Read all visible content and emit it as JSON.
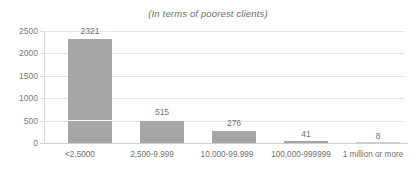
{
  "chart_data": {
    "type": "bar",
    "title": "(In terms of poorest clients)",
    "xlabel": "",
    "ylabel": "",
    "categories": [
      "<2,5000",
      "2,500-9.999",
      "10.000-99.999",
      "100,000-999999",
      "1 million or more"
    ],
    "values": [
      2321,
      515,
      276,
      41,
      8
    ],
    "datalabels": [
      "2321",
      "515",
      "276",
      "41",
      "8"
    ],
    "ylim": [
      0,
      2500
    ],
    "yticks": [
      0,
      500,
      1000,
      1500,
      2000,
      2500
    ],
    "ytick_labels": [
      "0",
      "500",
      "1000",
      "1500",
      "2000",
      "2500"
    ],
    "grid": true,
    "legend": false,
    "series": [
      {
        "name": "Number of institutions",
        "values": [
          2321,
          515,
          276,
          41,
          8
        ],
        "color": "#a6a6a6"
      }
    ],
    "colors": {
      "bar": "#a6a6a6",
      "gridline": "#e4e4e4",
      "axis": "#d0d0d0",
      "text": "#6f6f6f",
      "title_text": "#6d6d6d",
      "background": "#ffffff"
    }
  }
}
